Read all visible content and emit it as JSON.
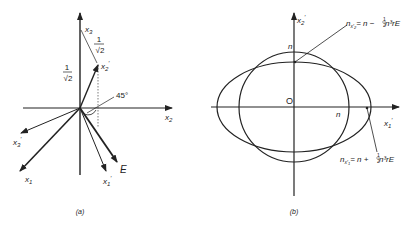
{
  "panel_a": {
    "caption": "(a)",
    "axes": {
      "x1": "x",
      "x1_sub": "1",
      "x2": "x",
      "x2_sub": "2",
      "x3": "x",
      "x3_sub": "3"
    },
    "rotated_axes": {
      "x1p": "x",
      "x1p_sub": "1",
      "x2p": "x",
      "x2p_sub": "2",
      "x3p": "x",
      "x3p_sub": "3",
      "prime": "′"
    },
    "field_label": "E",
    "angle_label": "45°",
    "fraction_left": {
      "num": "1",
      "den": "√2"
    },
    "fraction_top": {
      "num": "1",
      "den": "√2"
    }
  },
  "panel_b": {
    "caption": "(b)",
    "origin_label": "O",
    "axis_h": "x",
    "axis_h_sub": "1",
    "axis_v": "x",
    "axis_v_sub": "2",
    "prime": "′",
    "n_top": "n",
    "n_right": "n",
    "annotation_top": "n_{x2'} = n − ½ n³ r E",
    "annotation_top_parts": {
      "n": "n",
      "sub": "x′",
      "subsub": "2",
      "rhs": "= n − ",
      "frac_num": "1",
      "frac_den": "2",
      "tail": " n³rE"
    },
    "annotation_bottom": "n_{x1'} = n + ½ n³ r E",
    "annotation_bottom_parts": {
      "n": "n",
      "sub": "x′",
      "subsub": "1",
      "rhs": "= n + ",
      "frac_num": "1",
      "frac_den": "2",
      "tail": " n³rE"
    }
  }
}
